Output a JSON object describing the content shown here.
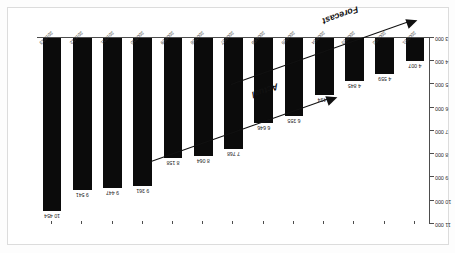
{
  "chart_data": {
    "type": "bar",
    "title": "",
    "xlabel": "",
    "ylabel": "10 000 ha",
    "ylim": [
      3000,
      11000
    ],
    "ytick_values": [
      3000,
      4000,
      5000,
      6000,
      7000,
      8000,
      9000,
      10000,
      11000
    ],
    "ytick_labels": [
      "3 000",
      "4 000",
      "5 000",
      "6 000",
      "7 000",
      "8 000",
      "9 000",
      "10 000",
      "11 000"
    ],
    "grid": false,
    "legend": "none",
    "categories": [
      "2000/01",
      "2001/02",
      "2002/03",
      "2003/04",
      "2004/05",
      "2005/06",
      "2006/07",
      "2007/08",
      "2008/09",
      "2009/10",
      "2010/11",
      "2011/12",
      "2012/13"
    ],
    "values": [
      4007,
      4559,
      4845,
      5434,
      6355,
      6646,
      7768,
      8064,
      8158,
      9361,
      9447,
      9541,
      10454
    ],
    "value_labels": [
      "4 007",
      "4 559",
      "4 845",
      "5 434",
      "6 355",
      "6 646",
      "7 768",
      "8 064",
      "8 158",
      "9 361",
      "9 447",
      "9 541",
      "10 454"
    ],
    "bar_color": "#0b0b0b",
    "annotations": [
      {
        "text": "Actual",
        "name": "actual-trend"
      },
      {
        "text": "Forecast",
        "name": "forecast-trend"
      }
    ]
  }
}
